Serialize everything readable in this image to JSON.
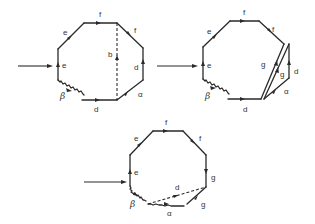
{
  "figure": {
    "colors": {
      "stroke": "#2a2a2a",
      "text": "#333333",
      "background": "#ffffff"
    }
  },
  "transition_arrows": [
    {
      "id": "arrow-1",
      "from": [
        18,
        66
      ],
      "to": [
        52,
        66
      ]
    },
    {
      "id": "arrow-2",
      "from": [
        157,
        66
      ],
      "to": [
        197,
        66
      ]
    },
    {
      "id": "arrow-3",
      "from": [
        84,
        182
      ],
      "to": [
        126,
        182
      ]
    }
  ],
  "stages": [
    {
      "id": "stage-1",
      "labels": {
        "top": "f",
        "upper_left": "e",
        "left": "e",
        "lower_left": "β",
        "bottom": "d",
        "lower_right": "α",
        "right": "d",
        "upper_right": "f",
        "diagonal": "b"
      }
    },
    {
      "id": "stage-2",
      "labels": {
        "top": "f",
        "upper_left": "e",
        "left": "e",
        "lower_left": "β",
        "bottom": "d",
        "upper_right": "f",
        "cut_outer": "g",
        "cut_inner": "g",
        "flap_right": "d",
        "flap_bottom": "α"
      }
    },
    {
      "id": "stage-3",
      "labels": {
        "top": "f",
        "upper_left": "e",
        "left": "e",
        "lower_left": "β",
        "bottom": "α",
        "lower_right": "g",
        "right": "g",
        "upper_right": "f",
        "diagonal": "d"
      }
    }
  ]
}
